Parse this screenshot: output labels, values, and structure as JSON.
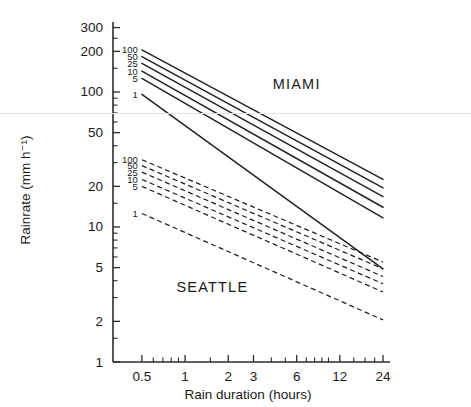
{
  "chart_data": {
    "type": "line",
    "title": "",
    "xlabel": "Rain duration (hours)",
    "ylabel": "Rainrate (mm h⁻¹)",
    "xscale": "log",
    "yscale": "log",
    "xlim": [
      0.4,
      26
    ],
    "ylim": [
      1,
      330
    ],
    "xticks": [
      0.5,
      1,
      2,
      3,
      6,
      12,
      24
    ],
    "xticklabels": [
      "0.5",
      "1",
      "2",
      "3",
      "6",
      "12",
      "24"
    ],
    "yticks": [
      1,
      2,
      5,
      10,
      20,
      50,
      100,
      200,
      300
    ],
    "yticklabels": [
      "1",
      "2",
      "5",
      "10",
      "20",
      "50",
      "100",
      "200",
      "300"
    ],
    "grid": false,
    "legend": "inline-curve-labels",
    "annotations": [
      {
        "text": "MIAMI",
        "x": 6.0,
        "y": 105
      },
      {
        "text": "SEATTLE",
        "x": 1.55,
        "y": 3.3
      }
    ],
    "series": [
      {
        "name": "MIAMI 100",
        "group": "MIAMI",
        "return_period_years": 100,
        "style": "solid",
        "label": "100",
        "x": [
          0.5,
          24
        ],
        "y": [
          205,
          22.5
        ]
      },
      {
        "name": "MIAMI 50",
        "group": "MIAMI",
        "return_period_years": 50,
        "style": "solid",
        "label": "50",
        "x": [
          0.5,
          24
        ],
        "y": [
          183,
          19.5
        ]
      },
      {
        "name": "MIAMI 25",
        "group": "MIAMI",
        "return_period_years": 25,
        "style": "solid",
        "label": "25",
        "x": [
          0.5,
          24
        ],
        "y": [
          163,
          16.8
        ]
      },
      {
        "name": "MIAMI 10",
        "group": "MIAMI",
        "return_period_years": 10,
        "style": "solid",
        "label": "10",
        "x": [
          0.5,
          24
        ],
        "y": [
          143,
          14.0
        ]
      },
      {
        "name": "MIAMI 5",
        "group": "MIAMI",
        "return_period_years": 5,
        "style": "solid",
        "label": "5",
        "x": [
          0.5,
          24
        ],
        "y": [
          126,
          11.7
        ]
      },
      {
        "name": "MIAMI 1",
        "group": "MIAMI",
        "return_period_years": 1,
        "style": "solid",
        "label": "1",
        "x": [
          0.5,
          24
        ],
        "y": [
          96,
          4.9
        ]
      },
      {
        "name": "SEATTLE 100",
        "group": "SEATTLE",
        "return_period_years": 100,
        "style": "dashed",
        "label": "100",
        "x": [
          0.5,
          24
        ],
        "y": [
          31.5,
          5.5
        ]
      },
      {
        "name": "SEATTLE 50",
        "group": "SEATTLE",
        "return_period_years": 50,
        "style": "dashed",
        "label": "50",
        "x": [
          0.5,
          24
        ],
        "y": [
          28.5,
          4.9
        ]
      },
      {
        "name": "SEATTLE 25",
        "group": "SEATTLE",
        "return_period_years": 25,
        "style": "dashed",
        "label": "25",
        "x": [
          0.5,
          24
        ],
        "y": [
          25.5,
          4.3
        ]
      },
      {
        "name": "SEATTLE 10",
        "group": "SEATTLE",
        "return_period_years": 10,
        "style": "dashed",
        "label": "10",
        "x": [
          0.5,
          24
        ],
        "y": [
          22.5,
          3.8
        ]
      },
      {
        "name": "SEATTLE 5",
        "group": "SEATTLE",
        "return_period_years": 5,
        "style": "dashed",
        "label": "5",
        "x": [
          0.5,
          24
        ],
        "y": [
          20.0,
          3.3
        ]
      },
      {
        "name": "SEATTLE 1",
        "group": "SEATTLE",
        "return_period_years": 1,
        "style": "dashed",
        "label": "1",
        "x": [
          0.5,
          24
        ],
        "y": [
          12.6,
          2.05
        ]
      }
    ]
  },
  "axes": {
    "ylabel": "Rainrate (mm h⁻¹)",
    "xlabel": "Rain duration (hours)"
  }
}
